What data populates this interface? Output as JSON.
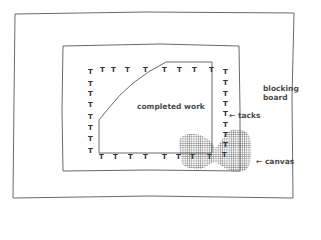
{
  "diagram": {
    "labels": {
      "completed_work": "completed work",
      "tacks": "← tacks",
      "blocking_board_line1": "blocking",
      "blocking_board_line2": "board",
      "canvas": "← canvas"
    },
    "tack_glyph": "T",
    "colors": {
      "line": "#6a6a6a",
      "text": "#4a4a4a",
      "canvas_grid": "#555555"
    }
  }
}
